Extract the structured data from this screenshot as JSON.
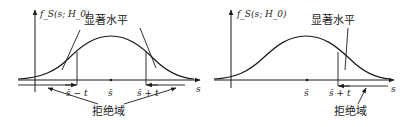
{
  "panels": [
    {
      "id": "two-tailed",
      "y_axis_label": "f_S(s; H_0)",
      "significance_label": "显著水平",
      "rejection_label": "拒绝域",
      "center_tick": "s̄",
      "left_bound": "s̄ − t",
      "right_bound": "s̄ + t",
      "x_axis_label": "s"
    },
    {
      "id": "one-tailed",
      "y_axis_label": "f_S(s; H_0)",
      "significance_label": "显著水平",
      "rejection_label": "拒绝域",
      "center_tick": "s̄",
      "right_bound": "s̄ + t",
      "x_axis_label": "s"
    }
  ]
}
